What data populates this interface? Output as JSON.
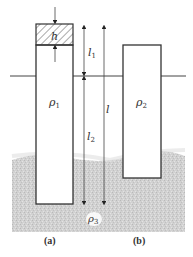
{
  "figure": {
    "labels": {
      "h": "h",
      "l1": "l",
      "l1_sub": "1",
      "l2": "l",
      "l2_sub": "2",
      "l": "l",
      "rho1": "ρ",
      "rho1_sub": "1",
      "rho2": "ρ",
      "rho2_sub": "2",
      "rho3": "ρ",
      "rho3_sub": "3"
    },
    "captions": {
      "a": "(a)",
      "b": "(b)"
    },
    "colors": {
      "outline": "#333333",
      "liquid": "#c8c8c8",
      "hatch": "#555555",
      "background": "#ffffff"
    }
  }
}
